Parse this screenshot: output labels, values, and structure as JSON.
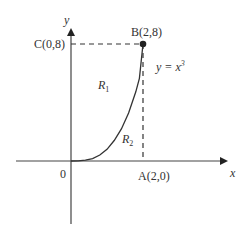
{
  "diagram": {
    "axes": {
      "x_label": "x",
      "y_label": "y",
      "origin_label": "0"
    },
    "points": {
      "A": {
        "label": "A(2,0)",
        "x": 2,
        "y": 0
      },
      "B": {
        "label": "B(2,8)",
        "x": 2,
        "y": 8
      },
      "C": {
        "label": "C(0,8)",
        "x": 0,
        "y": 8
      }
    },
    "curve": {
      "equation_label": "y = x",
      "exponent": "3"
    },
    "regions": {
      "R1": {
        "letter": "R",
        "subscript": "1"
      },
      "R2": {
        "letter": "R",
        "subscript": "2"
      }
    },
    "colors": {
      "line": "#333333",
      "background": "#ffffff"
    }
  }
}
